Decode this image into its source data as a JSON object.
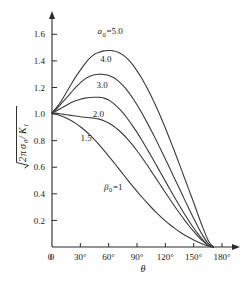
{
  "chart_data": {
    "type": "line",
    "title": "",
    "xlabel": "θ",
    "ylabel": "√(2πσ₀/K₁)",
    "xlim": [
      0,
      180
    ],
    "ylim": [
      0,
      1.7
    ],
    "grid": false,
    "legend_position": "inline-curve-labels",
    "xticks": [
      0,
      30,
      60,
      90,
      120,
      150,
      180
    ],
    "xticklabels": [
      "0",
      "30°",
      "60°",
      "90°",
      "120°",
      "150°",
      "180°"
    ],
    "yticks": [
      0.2,
      0.4,
      0.6,
      0.8,
      1.0,
      1.2,
      1.4,
      1.6
    ],
    "yticklabels": [
      "0.2",
      "0.4",
      "0.6",
      "0.8",
      "1.0",
      "1.2",
      "1.4",
      "1.6"
    ],
    "annotations": [
      {
        "text": "β₀=1",
        "x": 55,
        "y": 0.43
      }
    ],
    "series": [
      {
        "name": "a₀ =5.0",
        "label": "5.0",
        "label_prefix": "a₀ =",
        "label_x": 63,
        "label_y": 1.6,
        "x": [
          0,
          5,
          10,
          15,
          20,
          25,
          30,
          35,
          40,
          45,
          50,
          55,
          60,
          62,
          65,
          70,
          75,
          80,
          85,
          90,
          95,
          100,
          105,
          110,
          115,
          120,
          125,
          130,
          135,
          140,
          145,
          150,
          155,
          160,
          165,
          168,
          171
        ],
        "y": [
          1.01,
          1.05,
          1.1,
          1.16,
          1.22,
          1.28,
          1.33,
          1.38,
          1.42,
          1.45,
          1.465,
          1.475,
          1.478,
          1.478,
          1.475,
          1.465,
          1.445,
          1.415,
          1.375,
          1.325,
          1.27,
          1.205,
          1.135,
          1.06,
          0.98,
          0.895,
          0.805,
          0.715,
          0.62,
          0.525,
          0.43,
          0.335,
          0.235,
          0.14,
          0.055,
          0.022,
          0.0
        ]
      },
      {
        "name": "4.0",
        "label": "4.0",
        "label_prefix": "",
        "label_x": 57,
        "label_y": 1.39,
        "x": [
          0,
          5,
          10,
          15,
          20,
          25,
          30,
          35,
          40,
          45,
          50,
          55,
          58,
          60,
          65,
          70,
          75,
          80,
          85,
          90,
          95,
          100,
          105,
          110,
          115,
          120,
          125,
          130,
          135,
          140,
          145,
          150,
          155,
          160,
          165,
          168,
          171
        ],
        "y": [
          1.01,
          1.04,
          1.08,
          1.12,
          1.16,
          1.2,
          1.235,
          1.265,
          1.285,
          1.296,
          1.3,
          1.298,
          1.294,
          1.29,
          1.275,
          1.25,
          1.215,
          1.175,
          1.125,
          1.07,
          1.01,
          0.945,
          0.878,
          0.808,
          0.735,
          0.662,
          0.588,
          0.512,
          0.438,
          0.362,
          0.288,
          0.215,
          0.145,
          0.082,
          0.03,
          0.012,
          0.0
        ]
      },
      {
        "name": "3.0",
        "label": "3.0",
        "label_prefix": "",
        "label_x": 53,
        "label_y": 1.195,
        "x": [
          0,
          5,
          10,
          15,
          20,
          25,
          30,
          35,
          40,
          45,
          50,
          52,
          55,
          60,
          65,
          70,
          75,
          80,
          85,
          90,
          95,
          100,
          105,
          110,
          115,
          120,
          125,
          130,
          135,
          140,
          145,
          150,
          155,
          160,
          165,
          168,
          171
        ],
        "y": [
          1.01,
          1.025,
          1.045,
          1.065,
          1.085,
          1.1,
          1.112,
          1.12,
          1.125,
          1.127,
          1.126,
          1.125,
          1.12,
          1.105,
          1.08,
          1.048,
          1.01,
          0.965,
          0.915,
          0.862,
          0.805,
          0.745,
          0.685,
          0.622,
          0.558,
          0.495,
          0.432,
          0.37,
          0.31,
          0.252,
          0.196,
          0.143,
          0.095,
          0.052,
          0.018,
          0.007,
          0.0
        ]
      },
      {
        "name": "2.0",
        "label": "2.0",
        "label_prefix": "",
        "label_x": 49,
        "label_y": 0.975,
        "x": [
          0,
          5,
          10,
          15,
          20,
          25,
          30,
          35,
          40,
          42,
          45,
          50,
          55,
          60,
          65,
          70,
          75,
          80,
          85,
          90,
          95,
          100,
          105,
          110,
          115,
          120,
          125,
          130,
          135,
          140,
          145,
          150,
          155,
          160,
          165,
          168,
          171
        ],
        "y": [
          1.01,
          1.005,
          1.0,
          0.995,
          0.99,
          0.985,
          0.98,
          0.976,
          0.972,
          0.971,
          0.969,
          0.962,
          0.95,
          0.932,
          0.91,
          0.882,
          0.85,
          0.812,
          0.77,
          0.724,
          0.675,
          0.624,
          0.571,
          0.518,
          0.464,
          0.41,
          0.357,
          0.305,
          0.255,
          0.206,
          0.16,
          0.117,
          0.077,
          0.042,
          0.014,
          0.006,
          0.0
        ]
      },
      {
        "name": "1.5",
        "label": "1.5",
        "label_prefix": "",
        "label_x": 36,
        "label_y": 0.8,
        "x": [
          0,
          5,
          10,
          15,
          20,
          25,
          30,
          35,
          40,
          45,
          50,
          55,
          60,
          65,
          70,
          75,
          80,
          85,
          90,
          95,
          100,
          105,
          110,
          115,
          120,
          125,
          130,
          135,
          140,
          145,
          150,
          155,
          160,
          165,
          168,
          171
        ],
        "y": [
          1.01,
          0.998,
          0.985,
          0.97,
          0.952,
          0.93,
          0.905,
          0.876,
          0.843,
          0.807,
          0.768,
          0.727,
          0.684,
          0.64,
          0.595,
          0.55,
          0.505,
          0.461,
          0.418,
          0.377,
          0.337,
          0.299,
          0.263,
          0.229,
          0.197,
          0.167,
          0.14,
          0.115,
          0.092,
          0.072,
          0.053,
          0.036,
          0.02,
          0.007,
          0.003,
          0.0
        ]
      }
    ]
  },
  "style": {
    "axis_color": "#2b2b2b",
    "curve_color": "#3a3a3a",
    "text_color": "#1a1a1a",
    "background": "#ffffff"
  }
}
